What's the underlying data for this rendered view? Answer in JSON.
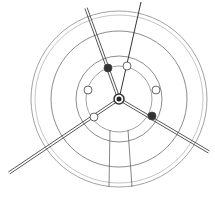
{
  "diagram": {
    "type": "technical-line-drawing",
    "background": "#ffffff",
    "stroke_color": "#555555",
    "center": [
      119,
      99
    ],
    "circles": [
      {
        "r": 88,
        "stroke": "#8a8a8a"
      },
      {
        "r": 84,
        "stroke": "#b5b5b5"
      },
      {
        "r": 68,
        "stroke": "#6e6e6e"
      },
      {
        "r": 43,
        "stroke": "#6e6e6e"
      },
      {
        "r": 33,
        "stroke": "#8a8a8a"
      }
    ],
    "holes": [
      {
        "cx": 108,
        "cy": 68,
        "r": 4,
        "filled": true
      },
      {
        "cx": 127,
        "cy": 66,
        "r": 4,
        "filled": false
      },
      {
        "cx": 88,
        "cy": 90,
        "r": 4,
        "filled": false
      },
      {
        "cx": 156,
        "cy": 90,
        "r": 4,
        "filled": false
      },
      {
        "cx": 94,
        "cy": 117,
        "r": 4,
        "filled": false
      },
      {
        "cx": 152,
        "cy": 116,
        "r": 4,
        "filled": true
      }
    ],
    "spokes": [
      {
        "from": [
          119,
          99
        ],
        "to": [
          86,
          8
        ],
        "double": true
      },
      {
        "from": [
          119,
          99
        ],
        "to": [
          141,
          2
        ],
        "double": false
      },
      {
        "from": [
          119,
          99
        ],
        "to": [
          9,
          173
        ],
        "double": true
      },
      {
        "from": [
          119,
          99
        ],
        "to": [
          209,
          152
        ],
        "double": true
      }
    ],
    "bottom_lines": [
      {
        "from": [
          110,
          130
        ],
        "to": [
          109,
          187
        ]
      },
      {
        "from": [
          128,
          130
        ],
        "to": [
          132,
          187
        ]
      }
    ]
  }
}
